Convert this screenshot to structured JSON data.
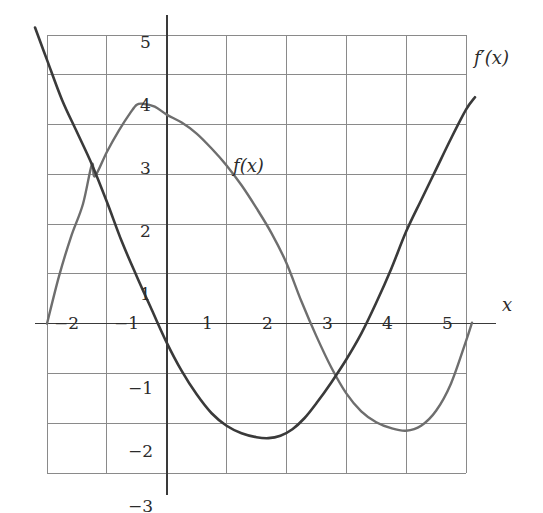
{
  "figure": {
    "background_color": "#ffffff",
    "grid_color": "#8a8a8a",
    "axis_color": "#3a3a3a",
    "text_color": "#2b2b2b"
  },
  "axis_labels": {
    "x_axis_name": "x"
  },
  "curve_labels": {
    "f": "f(x)",
    "fprime": "f′(x)"
  },
  "chart_data": {
    "type": "line",
    "title": "",
    "subtitle": "",
    "xlabel": "x",
    "ylabel": "",
    "grid": true,
    "legend_position": "inline-annotation",
    "xlim": [
      -2.35,
      5.35
    ],
    "ylim": [
      -3.2,
      5.95
    ],
    "xticks": [
      -2,
      -1,
      1,
      2,
      3,
      4,
      5
    ],
    "xtick_labels": [
      "−2",
      "−1",
      "1",
      "2",
      "3",
      "4",
      "5"
    ],
    "yticks": [
      -3,
      -2,
      -1,
      1,
      2,
      3,
      4,
      5
    ],
    "ytick_labels": [
      "−3",
      "−2",
      "−1",
      "1",
      "2",
      "3",
      "4",
      "5"
    ],
    "annotations": [
      {
        "text": "f(x)",
        "x": 1.45,
        "y": 3.05
      },
      {
        "text": "f′(x)",
        "x": 5.2,
        "y": 5.25
      },
      {
        "text": "x",
        "x": 5.55,
        "y": 0.35
      }
    ],
    "series": [
      {
        "name": "f(x)",
        "color": "#6e6e6e",
        "width": 2.4,
        "x": [
          -2.0,
          -1.8,
          -1.6,
          -1.4,
          -1.25,
          -1.2,
          -1.0,
          -0.8,
          -0.6,
          -0.5,
          -0.4,
          -0.2,
          0.0,
          0.25,
          0.5,
          0.75,
          1.0,
          1.25,
          1.5,
          1.75,
          2.0,
          2.25,
          2.5,
          2.75,
          3.0,
          3.25,
          3.5,
          3.75,
          4.0,
          4.25,
          4.5,
          4.75,
          5.0,
          5.1
        ],
        "y": [
          0.0,
          0.95,
          1.74,
          2.4,
          3.2,
          2.96,
          3.45,
          3.88,
          4.25,
          4.4,
          4.42,
          4.36,
          4.2,
          4.04,
          3.82,
          3.52,
          3.18,
          2.78,
          2.32,
          1.82,
          1.22,
          0.45,
          -0.25,
          -0.88,
          -1.4,
          -1.76,
          -1.98,
          -2.1,
          -2.15,
          -2.05,
          -1.75,
          -1.2,
          -0.35,
          0.02
        ]
      },
      {
        "name": "f'(x)",
        "color": "#3a3a3a",
        "width": 2.6,
        "x": [
          -2.2,
          -2.0,
          -1.75,
          -1.5,
          -1.25,
          -1.0,
          -0.75,
          -0.5,
          -0.25,
          0.0,
          0.25,
          0.5,
          0.75,
          1.0,
          1.25,
          1.5,
          1.7,
          1.9,
          2.1,
          2.3,
          2.5,
          2.75,
          3.0,
          3.25,
          3.5,
          3.75,
          4.0,
          4.25,
          4.5,
          4.75,
          5.0,
          5.15
        ],
        "y": [
          5.95,
          5.3,
          4.5,
          3.85,
          3.2,
          2.45,
          1.65,
          0.95,
          0.28,
          -0.38,
          -0.95,
          -1.42,
          -1.8,
          -2.05,
          -2.2,
          -2.28,
          -2.3,
          -2.25,
          -2.12,
          -1.9,
          -1.6,
          -1.18,
          -0.72,
          -0.2,
          0.42,
          1.1,
          1.85,
          2.48,
          3.1,
          3.72,
          4.3,
          4.55
        ]
      }
    ],
    "key_points": {
      "f_x_intercepts": [
        -2.0,
        2.28,
        5.08
      ],
      "f_local_max": {
        "x": -0.45,
        "y": 4.42
      },
      "f_local_min": {
        "x": 4.0,
        "y": -2.15
      },
      "fprime_x_intercepts": [
        -0.13,
        3.33
      ],
      "fprime_local_min": {
        "x": 1.72,
        "y": -2.3
      },
      "curve_intersection": {
        "x": -1.25,
        "y": 3.2
      }
    }
  }
}
